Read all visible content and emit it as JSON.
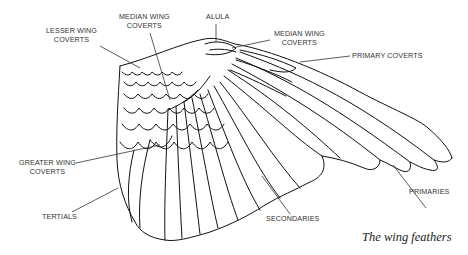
{
  "figure": {
    "caption": "The wing feathers",
    "labels": {
      "lesser_wing_coverts": {
        "line1": "LESSER WING",
        "line2": "COVERTS"
      },
      "median_wing_coverts_left": {
        "line1": "MEDIAN WING",
        "line2": "COVERTS"
      },
      "alula": {
        "line1": "ALULA"
      },
      "median_wing_coverts_right": {
        "line1": "MEDIAN WING",
        "line2": "COVERTS"
      },
      "primary_coverts": {
        "line1": "PRIMARY COVERTS"
      },
      "greater_wing_coverts": {
        "line1": "GREATER WING",
        "line2": "COVERTS"
      },
      "tertials": {
        "line1": "TERTIALS"
      },
      "secondaries": {
        "line1": "SECONDARIES"
      },
      "primaries": {
        "line1": "PRIMARIES"
      }
    },
    "colors": {
      "stroke": "#111111",
      "leader": "#333333",
      "background": "#ffffff"
    }
  }
}
